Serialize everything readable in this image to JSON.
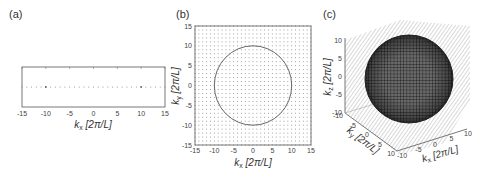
{
  "panels": {
    "a": {
      "label": "(a)"
    },
    "b": {
      "label": "(b)"
    },
    "c": {
      "label": "(c)"
    }
  },
  "chart_data": [
    {
      "panel": "(a)",
      "type": "scatter",
      "title": "",
      "description": "1D lattice of k-points along kx (dotted line of grid points)",
      "xlabel": "k_x [2π/L]",
      "ylabel": "",
      "xlim": [
        -15,
        15
      ],
      "xticks": [
        -15,
        -10,
        -5,
        0,
        5,
        10,
        15
      ],
      "x": [
        -15,
        -14,
        -13,
        -12,
        -11,
        -10,
        -9,
        -8,
        -7,
        -6,
        -5,
        -4,
        -3,
        -2,
        -1,
        0,
        1,
        2,
        3,
        4,
        5,
        6,
        7,
        8,
        9,
        10,
        11,
        12,
        13,
        14,
        15
      ],
      "highlighted_points": [
        -10,
        10
      ],
      "grid": false
    },
    {
      "panel": "(b)",
      "type": "scatter",
      "title": "",
      "description": "2D square lattice of k-points with a circle of radius 10 (Fermi circle)",
      "xlabel": "k_x [2π/L]",
      "ylabel": "k_y [2π/L]",
      "xlim": [
        -15,
        15
      ],
      "ylim": [
        -15,
        15
      ],
      "xticks": [
        -15,
        -10,
        -5,
        0,
        5,
        10,
        15
      ],
      "yticks": [
        -15,
        -10,
        -5,
        0,
        5,
        10,
        15
      ],
      "lattice_spacing": 1,
      "circle": {
        "center": [
          0,
          0
        ],
        "radius": 10
      },
      "grid": false
    },
    {
      "panel": "(c)",
      "type": "scatter",
      "title": "",
      "description": "3D cubic lattice of k-points with a sphere of radius 10 (Fermi sphere)",
      "xlabel": "k_x [2π/L]",
      "ylabel": "k_y [2π/L]",
      "zlabel": "k_z [2π/L]",
      "xlim": [
        -10,
        10
      ],
      "ylim": [
        -10,
        10
      ],
      "zlim": [
        -10,
        10
      ],
      "xticks": [
        -10,
        -5,
        0,
        5,
        10
      ],
      "yticks": [
        -10,
        -5,
        0,
        5,
        10
      ],
      "zticks": [
        -10,
        -5,
        0,
        5,
        10
      ],
      "sphere": {
        "center": [
          0,
          0,
          0
        ],
        "radius": 10
      },
      "grid": false
    }
  ],
  "axes": {
    "a": {
      "xticks": [
        "-15",
        "-10",
        "-5",
        "0",
        "5",
        "10",
        "15"
      ],
      "xlabel_k": "k",
      "xlabel_sub": "x",
      "xlabel_unit": " [2π/L]"
    },
    "b": {
      "xticks": [
        "-15",
        "-10",
        "-5",
        "0",
        "5",
        "10",
        "15"
      ],
      "yticks": [
        "15",
        "10",
        "5",
        "0",
        "-5",
        "-10",
        "-15"
      ],
      "xlabel_k": "k",
      "xlabel_sub": "x",
      "xlabel_unit": " [2π/L]",
      "ylabel_k": "k",
      "ylabel_sub": "y",
      "ylabel_unit": " [2π/L]"
    },
    "c": {
      "zticks": [
        "10",
        "5",
        "0",
        "-5",
        "-10"
      ],
      "yticks": [
        "-10",
        "-5",
        "0",
        "5",
        "10"
      ],
      "xticks": [
        "-10",
        "-5",
        "0",
        "5",
        "10"
      ],
      "zlabel_k": "k",
      "zlabel_sub": "z",
      "zlabel_unit": " [2π/L]",
      "ylabel_k": "k",
      "ylabel_sub": "y",
      "ylabel_unit": " [2π/L]",
      "xlabel_k": "k",
      "xlabel_sub": "x",
      "xlabel_unit": " [2π/L]"
    }
  },
  "colors": {
    "axis": "#555555",
    "dots": "#8a8a8a",
    "circle": "#555555",
    "sphere": "#2a2a2a",
    "lattice3d": "#b5b5b5"
  }
}
